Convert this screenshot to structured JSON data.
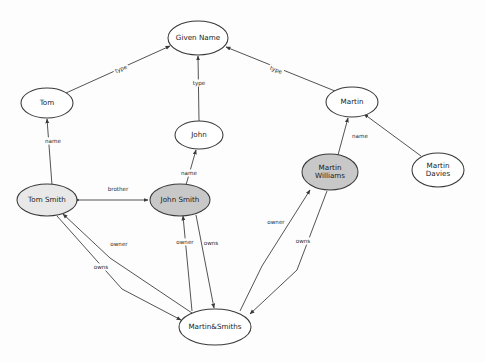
{
  "diagram": {
    "background_color": "#fdfdfd",
    "node_stroke_color": "#3a3a3a",
    "edge_color": "#4a4a4a",
    "fill_white": "#ffffff",
    "fill_light_gray": "#e8e8e8",
    "fill_mid_gray": "#c8c8c8",
    "nodes": [
      {
        "id": "given_name",
        "label": "Given Name",
        "label_lines": [
          "Given Name"
        ],
        "cx": 198,
        "cy": 38,
        "rx": 30,
        "ry": 17,
        "fill": "#ffffff"
      },
      {
        "id": "tom",
        "label": "Tom",
        "label_lines": [
          "Tom"
        ],
        "cx": 47,
        "cy": 103,
        "rx": 26,
        "ry": 15,
        "fill": "#ffffff"
      },
      {
        "id": "john",
        "label": "John",
        "label_lines": [
          "John"
        ],
        "cx": 199,
        "cy": 135,
        "rx": 24,
        "ry": 14,
        "fill": "#ffffff"
      },
      {
        "id": "martin",
        "label": "Martin",
        "label_lines": [
          "Martin"
        ],
        "cx": 352,
        "cy": 102,
        "rx": 26,
        "ry": 15,
        "fill": "#ffffff"
      },
      {
        "id": "martin_davies",
        "label": "Martin Davies",
        "label_lines": [
          "Martin",
          "Davies"
        ],
        "cx": 438,
        "cy": 170,
        "rx": 26,
        "ry": 17,
        "fill": "#ffffff"
      },
      {
        "id": "martin_williams",
        "label": "Martin Williams",
        "label_lines": [
          "Martin",
          "Williams"
        ],
        "cx": 330,
        "cy": 172,
        "rx": 28,
        "ry": 18,
        "fill": "#c8c8c8"
      },
      {
        "id": "tom_smith",
        "label": "Tom Smith",
        "label_lines": [
          "Tom Smith"
        ],
        "cx": 47,
        "cy": 200,
        "rx": 30,
        "ry": 16,
        "fill": "#e8e8e8"
      },
      {
        "id": "john_smith",
        "label": "John Smith",
        "label_lines": [
          "John Smith"
        ],
        "cx": 180,
        "cy": 200,
        "rx": 30,
        "ry": 16,
        "fill": "#c8c8c8"
      },
      {
        "id": "martin_smiths",
        "label": "Martin&Smiths",
        "label_lines": [
          "Martin&Smiths"
        ],
        "cx": 215,
        "cy": 327,
        "rx": 36,
        "ry": 18,
        "fill": "#ffffff"
      }
    ],
    "edges": [
      {
        "id": "e_tom_type",
        "from": "tom",
        "to": "given_name",
        "label": "type",
        "label_x": 121,
        "label_y": 69,
        "label_rot": -22,
        "path": "M 66 93 L 170 46",
        "arrow_end": true,
        "arrow_start": false
      },
      {
        "id": "e_john_type",
        "from": "john",
        "to": "given_name",
        "label": "type",
        "label_x": 199,
        "label_y": 83,
        "label_rot": 0,
        "path": "M 199 121 L 198 56",
        "arrow_end": true,
        "arrow_start": false
      },
      {
        "id": "e_martin_type",
        "from": "martin",
        "to": "given_name",
        "label": "type",
        "label_x": 276,
        "label_y": 70,
        "label_rot": 20,
        "path": "M 335 91 L 226 47",
        "arrow_end": true,
        "arrow_start": false
      },
      {
        "id": "e_tomsmith_name",
        "from": "tom_smith",
        "to": "tom",
        "label": "name",
        "label_x": 53,
        "label_y": 141,
        "label_rot": 0,
        "path": "M 52 185 L 47 119",
        "arrow_end": true,
        "arrow_start": false
      },
      {
        "id": "e_johnsmith_name",
        "from": "john_smith",
        "to": "john",
        "label": "name",
        "label_x": 189,
        "label_y": 173,
        "label_rot": 0,
        "path": "M 186 185 L 196 150",
        "arrow_end": true,
        "arrow_start": false
      },
      {
        "id": "e_williams_name",
        "from": "martin_williams",
        "to": "martin",
        "label": "name",
        "label_x": 360,
        "label_y": 136,
        "label_rot": 0,
        "path": "M 338 155 L 348 118",
        "arrow_end": true,
        "arrow_start": false
      },
      {
        "id": "e_davies_name",
        "from": "martin_davies",
        "to": "martin",
        "label": "",
        "label_x": 0,
        "label_y": 0,
        "label_rot": 0,
        "path": "M 421 156 L 364 114",
        "arrow_end": true,
        "arrow_start": false
      },
      {
        "id": "e_brother",
        "from": "tom_smith",
        "to": "john_smith",
        "label": "brother",
        "label_x": 118,
        "label_y": 189,
        "label_rot": 0,
        "path": "M 80 200 L 148 200",
        "arrow_end": true,
        "arrow_start": true
      },
      {
        "id": "e_ts_owner",
        "from": "martin_smiths",
        "to": "tom_smith",
        "label": "owner",
        "label_x": 119,
        "label_y": 244,
        "label_rot": 0,
        "path": "M 192 313 L 110 258 L 63 214",
        "arrow_end": true,
        "arrow_start": false
      },
      {
        "id": "e_ts_owns",
        "from": "tom_smith",
        "to": "martin_smiths",
        "label": "owns",
        "label_x": 101,
        "label_y": 267,
        "label_rot": 0,
        "path": "M 57 216 L 122 289 L 181 320",
        "arrow_end": true,
        "arrow_start": false
      },
      {
        "id": "e_js_owner",
        "from": "martin_smiths",
        "to": "john_smith",
        "label": "owner",
        "label_x": 185,
        "label_y": 242,
        "label_rot": 0,
        "path": "M 192 311 L 183 216",
        "arrow_end": true,
        "arrow_start": false
      },
      {
        "id": "e_js_owns",
        "from": "john_smith",
        "to": "martin_smiths",
        "label": "owns",
        "label_x": 211,
        "label_y": 243,
        "label_rot": 0,
        "path": "M 196 215 L 214 308",
        "arrow_end": true,
        "arrow_start": false
      },
      {
        "id": "e_mw_owner",
        "from": "martin_smiths",
        "to": "martin_williams",
        "label": "owner",
        "label_x": 276,
        "label_y": 222,
        "label_rot": 0,
        "path": "M 240 311 L 262 266 L 310 190",
        "arrow_end": true,
        "arrow_start": false
      },
      {
        "id": "e_mw_owns",
        "from": "martin_williams",
        "to": "martin_smiths",
        "label": "owns",
        "label_x": 303,
        "label_y": 241,
        "label_rot": 0,
        "path": "M 327 191 L 297 270 L 250 314",
        "arrow_end": true,
        "arrow_start": false
      }
    ],
    "ghost_watermark_rows": [
      "                                                      ",
      "                                                      "
    ]
  }
}
